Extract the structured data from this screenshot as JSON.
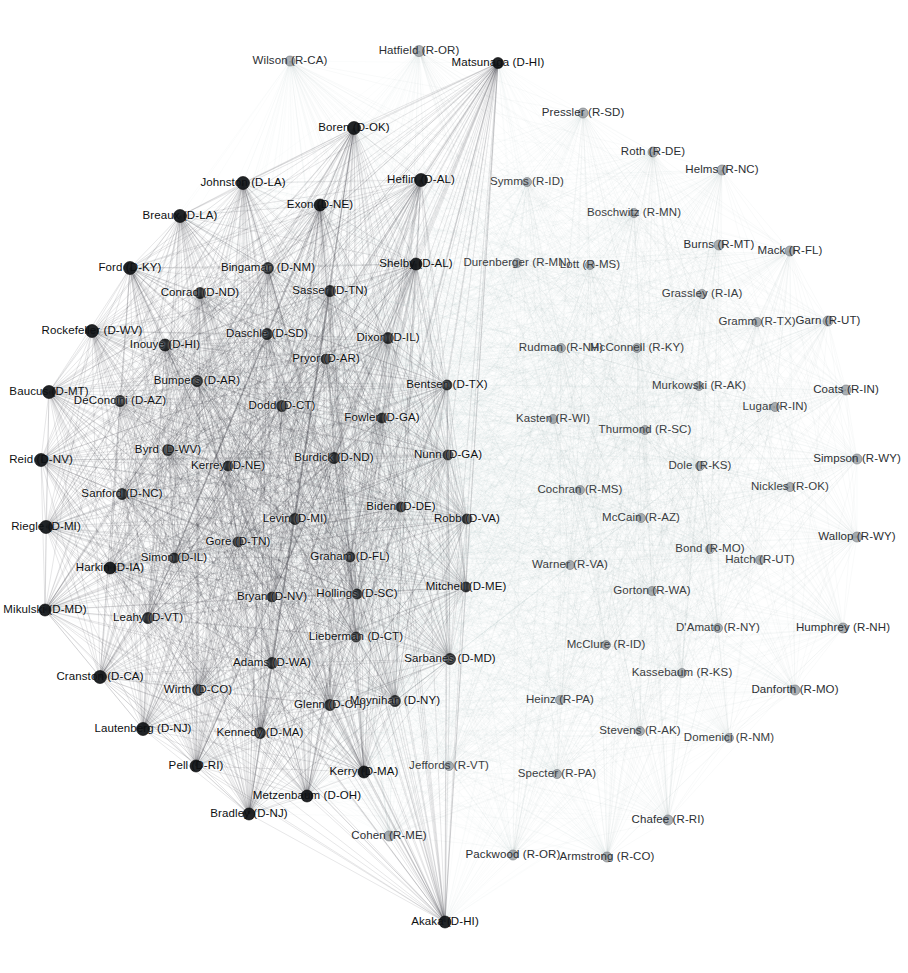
{
  "figure": {
    "kind": "force-directed-network",
    "title": "",
    "background": "#ffffff",
    "width": 908,
    "height": 973
  },
  "chart_data": {
    "type": "network",
    "title": "",
    "xlabel": "",
    "ylabel": "",
    "grid": false,
    "legend_position": "none",
    "node_colors": {
      "democrat": "#15181b",
      "republican": "#8e9398",
      "edge": "#9aa0a6"
    },
    "parties": [
      "D",
      "R"
    ],
    "node_count": 102,
    "nodes": [
      {
        "label": "Wilson (R-CA)",
        "party": "R",
        "x": 290,
        "y": 61,
        "r": 5.0,
        "anchor": "center",
        "cls": "rep"
      },
      {
        "label": "Hatfield (R-OR)",
        "party": "R",
        "x": 419,
        "y": 51,
        "r": 5.5,
        "anchor": "center",
        "cls": "rep"
      },
      {
        "label": "Matsunaga (D-HI)",
        "party": "D",
        "x": 498,
        "y": 63,
        "r": 5.5,
        "anchor": "center",
        "cls": "dem"
      },
      {
        "label": "Pressler (R-SD)",
        "party": "R",
        "x": 583,
        "y": 113,
        "r": 5.0,
        "anchor": "center",
        "cls": "rep"
      },
      {
        "label": "Boren (D-OK)",
        "party": "D",
        "x": 354,
        "y": 128,
        "r": 6.5,
        "anchor": "center",
        "cls": "dem"
      },
      {
        "label": "Roth (R-DE)",
        "party": "R",
        "x": 653,
        "y": 152,
        "r": 5.0,
        "anchor": "center",
        "cls": "rep"
      },
      {
        "label": "Helms (R-NC)",
        "party": "R",
        "x": 722,
        "y": 170,
        "r": 5.0,
        "anchor": "center",
        "cls": "rep"
      },
      {
        "label": "Johnston (D-LA)",
        "party": "D",
        "x": 243,
        "y": 183,
        "r": 6.5,
        "anchor": "center",
        "cls": "dem"
      },
      {
        "label": "Heflin (D-AL)",
        "party": "D",
        "x": 421,
        "y": 180,
        "r": 6.5,
        "anchor": "center",
        "cls": "dem"
      },
      {
        "label": "Symms (R-ID)",
        "party": "R",
        "x": 527,
        "y": 182,
        "r": 4.5,
        "anchor": "center",
        "cls": "light"
      },
      {
        "label": "Breaux (D-LA)",
        "party": "D",
        "x": 180,
        "y": 216,
        "r": 6.5,
        "anchor": "center",
        "cls": "dem"
      },
      {
        "label": "Exon (D-NE)",
        "party": "D",
        "x": 320,
        "y": 205,
        "r": 6.0,
        "anchor": "center",
        "cls": "dem"
      },
      {
        "label": "Boschwitz (R-MN)",
        "party": "R",
        "x": 634,
        "y": 213,
        "r": 4.5,
        "anchor": "center",
        "cls": "light"
      },
      {
        "label": "Burns (R-MT)",
        "party": "R",
        "x": 719,
        "y": 245,
        "r": 5.0,
        "anchor": "center",
        "cls": "rep"
      },
      {
        "label": "Mack (R-FL)",
        "party": "R",
        "x": 790,
        "y": 251,
        "r": 5.0,
        "anchor": "center",
        "cls": "rep"
      },
      {
        "label": "Ford (D-KY)",
        "party": "D",
        "x": 130,
        "y": 268,
        "r": 6.5,
        "anchor": "center",
        "cls": "dem"
      },
      {
        "label": "Bingaman (D-NM)",
        "party": "D",
        "x": 268,
        "y": 268,
        "r": 5.5,
        "anchor": "center",
        "cls": "dense"
      },
      {
        "label": "Shelby (D-AL)",
        "party": "D",
        "x": 416,
        "y": 264,
        "r": 6.0,
        "anchor": "center",
        "cls": "dem"
      },
      {
        "label": "Durenberger (R-MN)",
        "party": "R",
        "x": 517,
        "y": 263,
        "r": 4.5,
        "anchor": "center",
        "cls": "light"
      },
      {
        "label": "Lott (R-MS)",
        "party": "R",
        "x": 590,
        "y": 265,
        "r": 4.5,
        "anchor": "center",
        "cls": "light"
      },
      {
        "label": "Conrad (D-ND)",
        "party": "D",
        "x": 200,
        "y": 293,
        "r": 5.5,
        "anchor": "center",
        "cls": "dense"
      },
      {
        "label": "Sasser (D-TN)",
        "party": "D",
        "x": 330,
        "y": 291,
        "r": 5.5,
        "anchor": "center",
        "cls": "dense"
      },
      {
        "label": "Grassley (R-IA)",
        "party": "R",
        "x": 702,
        "y": 294,
        "r": 4.5,
        "anchor": "center",
        "cls": "light"
      },
      {
        "label": "Gramm (R-TX)",
        "party": "R",
        "x": 757,
        "y": 322,
        "r": 4.5,
        "anchor": "center",
        "cls": "light"
      },
      {
        "label": "Garn (R-UT)",
        "party": "R",
        "x": 828,
        "y": 321,
        "r": 5.0,
        "anchor": "center",
        "cls": "rep"
      },
      {
        "label": "Rockefeller (D-WV)",
        "party": "D",
        "x": 92,
        "y": 331,
        "r": 6.5,
        "anchor": "center",
        "cls": "dem"
      },
      {
        "label": "Inouye (D-HI)",
        "party": "D",
        "x": 165,
        "y": 345,
        "r": 6.0,
        "anchor": "center",
        "cls": "dense"
      },
      {
        "label": "Daschle (D-SD)",
        "party": "D",
        "x": 267,
        "y": 334,
        "r": 5.5,
        "anchor": "center",
        "cls": "dense"
      },
      {
        "label": "Dixon (D-IL)",
        "party": "D",
        "x": 388,
        "y": 338,
        "r": 5.5,
        "anchor": "center",
        "cls": "dense"
      },
      {
        "label": "Pryor (D-AR)",
        "party": "D",
        "x": 326,
        "y": 359,
        "r": 5.0,
        "anchor": "center",
        "cls": "dense"
      },
      {
        "label": "Rudman (R-NH)",
        "party": "R",
        "x": 561,
        "y": 348,
        "r": 4.5,
        "anchor": "center",
        "cls": "light"
      },
      {
        "label": "McConnell (R-KY)",
        "party": "R",
        "x": 637,
        "y": 348,
        "r": 4.5,
        "anchor": "center",
        "cls": "light"
      },
      {
        "label": "Murkowski (R-AK)",
        "party": "R",
        "x": 699,
        "y": 386,
        "r": 4.5,
        "anchor": "center",
        "cls": "light"
      },
      {
        "label": "Coats (R-IN)",
        "party": "R",
        "x": 846,
        "y": 390,
        "r": 5.0,
        "anchor": "center",
        "cls": "rep"
      },
      {
        "label": "Lugar (R-IN)",
        "party": "R",
        "x": 775,
        "y": 407,
        "r": 4.5,
        "anchor": "center",
        "cls": "light"
      },
      {
        "label": "Baucus (D-MT)",
        "party": "D",
        "x": 49,
        "y": 392,
        "r": 6.5,
        "anchor": "center",
        "cls": "dem"
      },
      {
        "label": "DeConcini (D-AZ)",
        "party": "D",
        "x": 120,
        "y": 401,
        "r": 5.5,
        "anchor": "center",
        "cls": "dense"
      },
      {
        "label": "Bumpers (D-AR)",
        "party": "D",
        "x": 197,
        "y": 381,
        "r": 5.5,
        "anchor": "center",
        "cls": "dense"
      },
      {
        "label": "Bentsen (D-TX)",
        "party": "D",
        "x": 447,
        "y": 385,
        "r": 5.0,
        "anchor": "center",
        "cls": "dense"
      },
      {
        "label": "Dodd (D-CT)",
        "party": "D",
        "x": 282,
        "y": 406,
        "r": 5.5,
        "anchor": "center",
        "cls": "dense"
      },
      {
        "label": "Fowler (D-GA)",
        "party": "D",
        "x": 382,
        "y": 418,
        "r": 5.0,
        "anchor": "center",
        "cls": "dense"
      },
      {
        "label": "Kasten (R-WI)",
        "party": "R",
        "x": 553,
        "y": 419,
        "r": 4.5,
        "anchor": "center",
        "cls": "light"
      },
      {
        "label": "Thurmond (R-SC)",
        "party": "R",
        "x": 645,
        "y": 430,
        "r": 4.5,
        "anchor": "center",
        "cls": "light"
      },
      {
        "label": "Byrd (D-WV)",
        "party": "D",
        "x": 168,
        "y": 450,
        "r": 5.5,
        "anchor": "center",
        "cls": "dense"
      },
      {
        "label": "Reid (D-NV)",
        "party": "D",
        "x": 41,
        "y": 460,
        "r": 6.5,
        "anchor": "center",
        "cls": "dem"
      },
      {
        "label": "Kerrey (D-NE)",
        "party": "D",
        "x": 228,
        "y": 466,
        "r": 5.0,
        "anchor": "center",
        "cls": "dense"
      },
      {
        "label": "Burdick (D-ND)",
        "party": "D",
        "x": 334,
        "y": 458,
        "r": 5.5,
        "anchor": "center",
        "cls": "dense"
      },
      {
        "label": "Nunn (D-GA)",
        "party": "D",
        "x": 448,
        "y": 455,
        "r": 5.0,
        "anchor": "center",
        "cls": "dense"
      },
      {
        "label": "Dole (R-KS)",
        "party": "R",
        "x": 700,
        "y": 466,
        "r": 4.5,
        "anchor": "center",
        "cls": "light"
      },
      {
        "label": "Simpson (R-WY)",
        "party": "R",
        "x": 857,
        "y": 459,
        "r": 5.0,
        "anchor": "center",
        "cls": "rep"
      },
      {
        "label": "Nickles (R-OK)",
        "party": "R",
        "x": 790,
        "y": 487,
        "r": 4.5,
        "anchor": "center",
        "cls": "light"
      },
      {
        "label": "Sanford (D-NC)",
        "party": "D",
        "x": 122,
        "y": 494,
        "r": 5.5,
        "anchor": "center",
        "cls": "dense"
      },
      {
        "label": "Cochran (R-MS)",
        "party": "R",
        "x": 580,
        "y": 490,
        "r": 4.5,
        "anchor": "center",
        "cls": "light"
      },
      {
        "label": "Levin (D-MI)",
        "party": "D",
        "x": 295,
        "y": 519,
        "r": 5.5,
        "anchor": "center",
        "cls": "dense"
      },
      {
        "label": "Biden (D-DE)",
        "party": "D",
        "x": 401,
        "y": 507,
        "r": 5.0,
        "anchor": "center",
        "cls": "dense"
      },
      {
        "label": "Robb (D-VA)",
        "party": "D",
        "x": 467,
        "y": 519,
        "r": 5.0,
        "anchor": "center",
        "cls": "dense"
      },
      {
        "label": "Riegle (D-MI)",
        "party": "D",
        "x": 46,
        "y": 527,
        "r": 6.5,
        "anchor": "center",
        "cls": "dem"
      },
      {
        "label": "McCain (R-AZ)",
        "party": "R",
        "x": 641,
        "y": 518,
        "r": 4.5,
        "anchor": "center",
        "cls": "light"
      },
      {
        "label": "Gore (D-TN)",
        "party": "D",
        "x": 238,
        "y": 542,
        "r": 5.0,
        "anchor": "center",
        "cls": "dense"
      },
      {
        "label": "Simon (D-IL)",
        "party": "D",
        "x": 174,
        "y": 558,
        "r": 5.0,
        "anchor": "center",
        "cls": "dense"
      },
      {
        "label": "Graham (D-FL)",
        "party": "D",
        "x": 350,
        "y": 557,
        "r": 5.0,
        "anchor": "center",
        "cls": "dense"
      },
      {
        "label": "Harkin (D-IA)",
        "party": "D",
        "x": 110,
        "y": 568,
        "r": 6.0,
        "anchor": "center",
        "cls": "dem"
      },
      {
        "label": "Bond (R-MO)",
        "party": "R",
        "x": 710,
        "y": 549,
        "r": 4.5,
        "anchor": "center",
        "cls": "light"
      },
      {
        "label": "Hatch (R-UT)",
        "party": "R",
        "x": 760,
        "y": 560,
        "r": 4.5,
        "anchor": "center",
        "cls": "light"
      },
      {
        "label": "Wallop (R-WY)",
        "party": "R",
        "x": 857,
        "y": 537,
        "r": 5.0,
        "anchor": "center",
        "cls": "rep"
      },
      {
        "label": "Warner (R-VA)",
        "party": "R",
        "x": 570,
        "y": 565,
        "r": 4.5,
        "anchor": "center",
        "cls": "light"
      },
      {
        "label": "Bryan (D-NV)",
        "party": "D",
        "x": 272,
        "y": 597,
        "r": 5.0,
        "anchor": "center",
        "cls": "dense"
      },
      {
        "label": "Hollings (D-SC)",
        "party": "D",
        "x": 357,
        "y": 594,
        "r": 5.0,
        "anchor": "center",
        "cls": "dense"
      },
      {
        "label": "Mitchell (D-ME)",
        "party": "D",
        "x": 466,
        "y": 587,
        "r": 5.0,
        "anchor": "center",
        "cls": "dense"
      },
      {
        "label": "Mikulski (D-MD)",
        "party": "D",
        "x": 45,
        "y": 610,
        "r": 6.0,
        "anchor": "center",
        "cls": "dem"
      },
      {
        "label": "Leahy (D-VT)",
        "party": "D",
        "x": 148,
        "y": 618,
        "r": 5.5,
        "anchor": "center",
        "cls": "dense"
      },
      {
        "label": "Gorton (R-WA)",
        "party": "R",
        "x": 652,
        "y": 591,
        "r": 4.5,
        "anchor": "center",
        "cls": "light"
      },
      {
        "label": "Lieberman (D-CT)",
        "party": "D",
        "x": 356,
        "y": 637,
        "r": 5.0,
        "anchor": "center",
        "cls": "dense"
      },
      {
        "label": "Sarbanes (D-MD)",
        "party": "D",
        "x": 450,
        "y": 659,
        "r": 5.5,
        "anchor": "center",
        "cls": "dense"
      },
      {
        "label": "D'Amato (R-NY)",
        "party": "R",
        "x": 718,
        "y": 628,
        "r": 4.5,
        "anchor": "center",
        "cls": "light"
      },
      {
        "label": "Humphrey (R-NH)",
        "party": "R",
        "x": 843,
        "y": 628,
        "r": 5.0,
        "anchor": "center",
        "cls": "rep"
      },
      {
        "label": "Cranston (D-CA)",
        "party": "D",
        "x": 100,
        "y": 677,
        "r": 6.5,
        "anchor": "center",
        "cls": "dem"
      },
      {
        "label": "Adams (D-WA)",
        "party": "D",
        "x": 272,
        "y": 663,
        "r": 5.5,
        "anchor": "center",
        "cls": "dense"
      },
      {
        "label": "McClure (R-ID)",
        "party": "R",
        "x": 606,
        "y": 645,
        "r": 4.5,
        "anchor": "center",
        "cls": "light"
      },
      {
        "label": "Kassebaum (R-KS)",
        "party": "R",
        "x": 682,
        "y": 673,
        "r": 4.5,
        "anchor": "center",
        "cls": "light"
      },
      {
        "label": "Danforth (R-MO)",
        "party": "R",
        "x": 795,
        "y": 690,
        "r": 5.0,
        "anchor": "center",
        "cls": "rep"
      },
      {
        "label": "Wirth (D-CO)",
        "party": "D",
        "x": 198,
        "y": 690,
        "r": 5.5,
        "anchor": "center",
        "cls": "dense"
      },
      {
        "label": "Glenn (D-OH)",
        "party": "D",
        "x": 330,
        "y": 705,
        "r": 5.5,
        "anchor": "center",
        "cls": "dense"
      },
      {
        "label": "Moynihan (D-NY)",
        "party": "D",
        "x": 395,
        "y": 701,
        "r": 5.5,
        "anchor": "center",
        "cls": "dense"
      },
      {
        "label": "Heinz (R-PA)",
        "party": "R",
        "x": 560,
        "y": 700,
        "r": 4.5,
        "anchor": "center",
        "cls": "light"
      },
      {
        "label": "Lautenberg (D-NJ)",
        "party": "D",
        "x": 143,
        "y": 729,
        "r": 6.5,
        "anchor": "center",
        "cls": "dem"
      },
      {
        "label": "Kennedy (D-MA)",
        "party": "D",
        "x": 260,
        "y": 733,
        "r": 5.5,
        "anchor": "center",
        "cls": "dense"
      },
      {
        "label": "Stevens (R-AK)",
        "party": "R",
        "x": 640,
        "y": 731,
        "r": 4.5,
        "anchor": "center",
        "cls": "light"
      },
      {
        "label": "Domenici (R-NM)",
        "party": "R",
        "x": 729,
        "y": 738,
        "r": 4.5,
        "anchor": "center",
        "cls": "light"
      },
      {
        "label": "Pell (D-RI)",
        "party": "D",
        "x": 196,
        "y": 766,
        "r": 6.0,
        "anchor": "center",
        "cls": "dem"
      },
      {
        "label": "Kerry (D-MA)",
        "party": "D",
        "x": 364,
        "y": 772,
        "r": 6.0,
        "anchor": "center",
        "cls": "dem"
      },
      {
        "label": "Jeffords (R-VT)",
        "party": "R",
        "x": 449,
        "y": 766,
        "r": 4.5,
        "anchor": "center",
        "cls": "light"
      },
      {
        "label": "Specter (R-PA)",
        "party": "R",
        "x": 557,
        "y": 774,
        "r": 4.5,
        "anchor": "center",
        "cls": "light"
      },
      {
        "label": "Metzenbaum (D-OH)",
        "party": "D",
        "x": 307,
        "y": 796,
        "r": 6.0,
        "anchor": "center",
        "cls": "dem"
      },
      {
        "label": "Bradley (D-NJ)",
        "party": "D",
        "x": 249,
        "y": 814,
        "r": 6.0,
        "anchor": "center",
        "cls": "dem"
      },
      {
        "label": "Chafee (R-RI)",
        "party": "R",
        "x": 668,
        "y": 820,
        "r": 5.0,
        "anchor": "center",
        "cls": "rep"
      },
      {
        "label": "Cohen (R-ME)",
        "party": "R",
        "x": 389,
        "y": 836,
        "r": 5.0,
        "anchor": "center",
        "cls": "rep"
      },
      {
        "label": "Packwood (R-OR)",
        "party": "R",
        "x": 513,
        "y": 855,
        "r": 5.0,
        "anchor": "center",
        "cls": "rep"
      },
      {
        "label": "Armstrong (R-CO)",
        "party": "R",
        "x": 607,
        "y": 857,
        "r": 5.0,
        "anchor": "center",
        "cls": "rep"
      },
      {
        "label": "Akaka (D-HI)",
        "party": "D",
        "x": 445,
        "y": 922,
        "r": 6.0,
        "anchor": "center",
        "cls": "dem"
      }
    ]
  }
}
